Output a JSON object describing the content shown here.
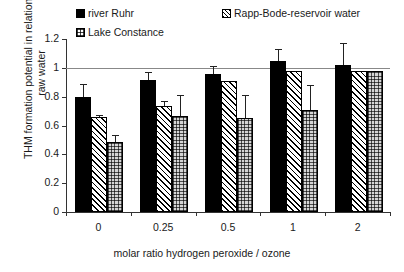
{
  "chart_data": {
    "type": "bar",
    "title": "",
    "xlabel": "molar ratio hydrogen peroxide / ozone",
    "ylabel": "THM formation potential in relation to raw water",
    "categories": [
      "0",
      "0.25",
      "0.5",
      "1",
      "2"
    ],
    "ylim": [
      0,
      1.2
    ],
    "yticks": [
      "0",
      "0.2",
      "0.4",
      "0.6",
      "0.8",
      "1",
      "1.2"
    ],
    "grid": false,
    "reference_line": 1.0,
    "legend_position": "top",
    "series": [
      {
        "name": "river Ruhr",
        "pattern": "solid-black",
        "values": [
          0.8,
          0.915,
          0.96,
          1.05,
          1.02
        ],
        "errors": [
          0.085,
          0.055,
          0.055,
          0.08,
          0.15
        ]
      },
      {
        "name": "Rapp-Bode-reservoir water",
        "pattern": "diagonal-hatch",
        "values": [
          0.66,
          0.735,
          0.91,
          0.98,
          0.98
        ],
        "errors": [
          0.015,
          0.035,
          0.0,
          0.0,
          0.0
        ]
      },
      {
        "name": "Lake Constance",
        "pattern": "grid-hatch",
        "values": [
          0.485,
          0.665,
          0.65,
          0.71,
          0.98
        ],
        "errors": [
          0.05,
          0.145,
          0.16,
          0.17,
          0.0
        ]
      }
    ]
  }
}
